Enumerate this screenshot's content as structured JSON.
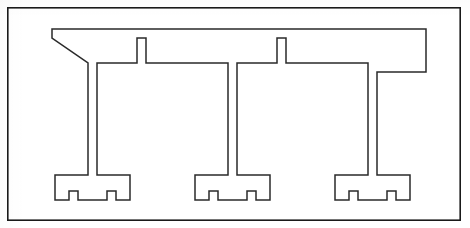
{
  "figure": {
    "domain": "technical-line-drawing",
    "canvas": {
      "width": 470,
      "height": 228,
      "background": "#ffffff"
    },
    "frame": {
      "name": "figure-border",
      "x": 7,
      "y": 7,
      "width": 454,
      "height": 214,
      "stroke": "#1a1a1a",
      "stroke_width": 1.6,
      "fill": "none"
    },
    "profile": {
      "name": "rail-profile-outline",
      "stroke": "#2a2a2a",
      "stroke_width": 1.5,
      "fill": "none",
      "wall_thickness": 9,
      "description": "Single closed outline: a horizontal top rail with three descending stems, each terminating in a T-shaped foot with a notch on either side.",
      "outer_path": "M 52 29 L 417 29 L 424 29 L 424 36 L 424 72 L 417 72 L 417 36 L 146 36 L 146 72 L 139 72 L 139 36 L 52 36 Z",
      "path_d": "M 52 29 L 426 29 L 426 74 L 419 74 L 419 36 L 148 36 L 148 74 L 141 74 L 141 36 L 52 36 Z",
      "segments": [
        {
          "name": "top-rail",
          "orientation": "horizontal",
          "x1": 52,
          "x2": 426,
          "y_top": 29,
          "y_bottom": 38,
          "thickness": 9
        },
        {
          "name": "stem-1",
          "orientation": "vertical",
          "x_left": 88,
          "x_right": 97,
          "y_top": 72,
          "y_bottom": 175,
          "thickness": 9
        },
        {
          "name": "stem-2",
          "orientation": "vertical",
          "x_left": 228,
          "x_right": 237,
          "y_top": 72,
          "y_bottom": 175,
          "thickness": 9
        },
        {
          "name": "stem-3",
          "orientation": "vertical",
          "x_left": 368,
          "x_right": 377,
          "y_top": 72,
          "y_bottom": 175,
          "thickness": 9
        },
        {
          "name": "shoulder-1",
          "orientation": "horizontal",
          "x1": 88,
          "x2": 146,
          "y_top": 63,
          "y_bottom": 72
        },
        {
          "name": "shoulder-2",
          "orientation": "horizontal",
          "x1": 228,
          "x2": 286,
          "y_top": 63,
          "y_bottom": 72
        },
        {
          "name": "shoulder-3",
          "orientation": "horizontal",
          "x1": 368,
          "x2": 426,
          "y_top": 63,
          "y_bottom": 72
        },
        {
          "name": "riser-1",
          "orientation": "vertical",
          "x_left": 137,
          "x_right": 146,
          "y_top": 38,
          "y_bottom": 72
        },
        {
          "name": "riser-2",
          "orientation": "vertical",
          "x_left": 277,
          "x_right": 286,
          "y_top": 38,
          "y_bottom": 72
        },
        {
          "name": "riser-3",
          "orientation": "vertical",
          "x_left": 417,
          "x_right": 426,
          "y_top": 38,
          "y_bottom": 72
        }
      ],
      "feet": [
        {
          "name": "foot-1",
          "stem_center_x": 92.5,
          "outer_left": 55,
          "outer_right": 130,
          "top_y": 175,
          "bottom_y": 200,
          "notch_width": 14,
          "notch_depth": 9,
          "thickness": 9
        },
        {
          "name": "foot-2",
          "stem_center_x": 232.5,
          "outer_left": 195,
          "outer_right": 270,
          "top_y": 175,
          "bottom_y": 200,
          "notch_width": 14,
          "notch_depth": 9,
          "thickness": 9
        },
        {
          "name": "foot-3",
          "stem_center_x": 372.5,
          "outer_left": 335,
          "outer_right": 410,
          "top_y": 175,
          "bottom_y": 200,
          "notch_width": 14,
          "notch_depth": 9,
          "thickness": 9
        }
      ],
      "repeat_count": 3,
      "repeat_pitch": 140
    }
  }
}
